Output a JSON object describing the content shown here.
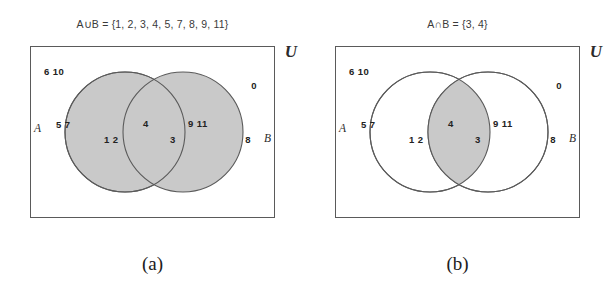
{
  "figure": {
    "panels": [
      {
        "id": "union",
        "title": "A∪B = {1, 2, 3, 4, 5, 7, 8, 9, 11}",
        "subcaption": "(a)",
        "universe_label": "U",
        "set_a_label": "A",
        "set_b_label": "B",
        "shading": "both-circles",
        "shade_color": "#c9c9c9",
        "outline_color": "#5a5a5a",
        "elements": {
          "outside_left": "6 10",
          "outside_right": "0",
          "a_edge": "5 7",
          "a_only": "1 2",
          "lens_left": "4",
          "lens_right": "3",
          "b_only": "9 11",
          "b_edge": "8"
        }
      },
      {
        "id": "intersection",
        "title": "A∩B = {3, 4}",
        "subcaption": "(b)",
        "universe_label": "U",
        "set_a_label": "A",
        "set_b_label": "B",
        "shading": "lens-only",
        "shade_color": "#c9c9c9",
        "outline_color": "#5a5a5a",
        "elements": {
          "outside_left": "6 10",
          "outside_right": "0",
          "a_edge": "5 7",
          "a_only": "1 2",
          "lens_left": "4",
          "lens_right": "3",
          "b_only": "9 11",
          "b_edge": "8"
        }
      }
    ]
  }
}
